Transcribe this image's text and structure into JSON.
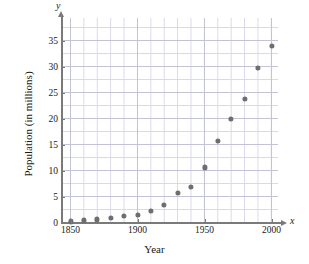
{
  "chart_data": {
    "type": "scatter",
    "title": "",
    "xlabel": "Year",
    "ylabel": "Population (in millions)",
    "x_axis_symbol": "x",
    "y_axis_symbol": "y",
    "xlim": [
      1840,
      2001
    ],
    "ylim": [
      0,
      39.4
    ],
    "grid": true,
    "grid_major_x_step": 50,
    "grid_minor_x_step": 10,
    "grid_major_y_step": 5,
    "grid_minor_y_step": 2.5,
    "legend": "none",
    "xticks": [
      1850,
      1900,
      1950,
      2000
    ],
    "xtick_labels": [
      "1850",
      "1900",
      "1950",
      "2000"
    ],
    "yticks": [
      0,
      5,
      10,
      15,
      20,
      25,
      30,
      35
    ],
    "ytick_labels": [
      "0",
      "5",
      "10",
      "15",
      "20",
      "25",
      "30",
      "35"
    ],
    "marker_color": "#6e6e6e",
    "axis_color": "#7a7a7a",
    "grid_color_minor": "#d9d9ea",
    "grid_color_major": "#c3c3d6",
    "x": [
      1850,
      1860,
      1870,
      1880,
      1890,
      1900,
      1910,
      1920,
      1930,
      1940,
      1950,
      1960,
      1970,
      1980,
      1990,
      2000
    ],
    "values": [
      0.2,
      0.4,
      0.6,
      0.9,
      1.2,
      1.5,
      2.3,
      3.4,
      5.7,
      6.9,
      10.6,
      15.7,
      20.0,
      23.7,
      29.8,
      33.9
    ],
    "points": [
      {
        "year": 1850,
        "population": 0.2
      },
      {
        "year": 1860,
        "population": 0.4
      },
      {
        "year": 1870,
        "population": 0.6
      },
      {
        "year": 1880,
        "population": 0.9
      },
      {
        "year": 1890,
        "population": 1.2
      },
      {
        "year": 1900,
        "population": 1.5
      },
      {
        "year": 1910,
        "population": 2.3
      },
      {
        "year": 1920,
        "population": 3.4
      },
      {
        "year": 1930,
        "population": 5.7
      },
      {
        "year": 1940,
        "population": 6.9
      },
      {
        "year": 1950,
        "population": 10.6
      },
      {
        "year": 1960,
        "population": 15.7
      },
      {
        "year": 1970,
        "population": 20.0
      },
      {
        "year": 1980,
        "population": 23.7
      },
      {
        "year": 1990,
        "population": 29.8
      },
      {
        "year": 2000,
        "population": 33.9
      }
    ]
  }
}
